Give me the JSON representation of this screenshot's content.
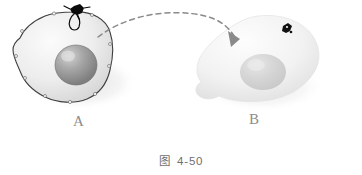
{
  "figure": {
    "caption_prefix": "图",
    "caption_number": "4-50",
    "caption_full": "图 4-50"
  },
  "cells": [
    {
      "id": "A",
      "label": "A",
      "role": "donor-cell",
      "outlined": true,
      "membrane_outline_color": "#3a3a3a",
      "cytoplasm_color": "#e8e8e8",
      "nucleus_color": "#9a9a9a",
      "has_surface_marker": true,
      "marker_position": "membrane-top",
      "marker_color": "#000000"
    },
    {
      "id": "B",
      "label": "B",
      "role": "recipient-cell",
      "outlined": false,
      "membrane_outline_color": "none",
      "cytoplasm_color": "#f1f1f1",
      "nucleus_color": "#d8d8d8",
      "has_surface_marker": true,
      "marker_position": "upper-right-interior",
      "marker_color": "#000000"
    }
  ],
  "arrow": {
    "name": "transfer-arrow",
    "style": "dashed-curved",
    "color": "#8a8a8a",
    "from_cell": "A",
    "to_cell": "B",
    "arrowhead": "filled-triangle"
  },
  "colors": {
    "background": "#ffffff",
    "label_text": "#8d8d8d",
    "caption_text": "#6f6f6f",
    "outline_dark": "#3a3a3a",
    "marker_black": "#000000",
    "arrow_gray": "#8a8a8a"
  }
}
